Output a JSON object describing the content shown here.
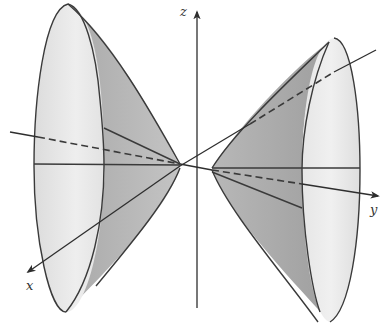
{
  "figure": {
    "colors": {
      "background": "#ffffff",
      "base_light": "#e6e6e6",
      "cone_dark": "#a8a8a8",
      "cone_mid": "#bdbdbd",
      "stroke": "#3a3a3a"
    }
  },
  "axes": {
    "x_label": "x",
    "y_label": "y",
    "z_label": "z"
  }
}
